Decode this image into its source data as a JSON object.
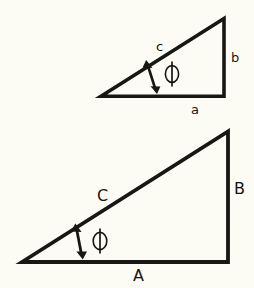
{
  "figure": {
    "background_color": "#fcfcf5",
    "ink_color": "#171714"
  },
  "small_triangle": {
    "name": "small-right-triangle",
    "vertices": {
      "left": [
        22,
        97
      ],
      "apex": [
        224,
        18
      ],
      "right": [
        224,
        97
      ]
    },
    "render_vertices": {
      "left": [
        101,
        97
      ],
      "apex": [
        224,
        18
      ],
      "right": [
        224,
        97
      ]
    },
    "stroke_width": 3.6,
    "labels": {
      "hypotenuse": "c",
      "vertical": "b",
      "horizontal": "a"
    },
    "angle": {
      "symbol": "ϕ",
      "name": "phi",
      "marker": "double-headed-arrow"
    }
  },
  "large_triangle": {
    "name": "large-right-triangle",
    "vertices": {
      "left": [
        22,
        263
      ],
      "apex": [
        228,
        131
      ],
      "right": [
        228,
        263
      ]
    },
    "stroke_width": 3.8,
    "labels": {
      "hypotenuse": "C",
      "vertical": "B",
      "horizontal": "A"
    },
    "angle": {
      "symbol": "ϕ",
      "name": "phi",
      "marker": "double-headed-arrow"
    }
  }
}
